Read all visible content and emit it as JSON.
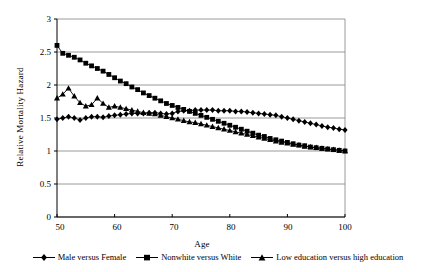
{
  "chart_data": {
    "type": "line",
    "title": "",
    "xlabel": "Age",
    "ylabel": "Relative Mortality Hazard",
    "xlim": [
      50,
      100
    ],
    "ylim": [
      0,
      3
    ],
    "xticks": [
      50,
      60,
      70,
      80,
      90,
      100
    ],
    "yticks": [
      0,
      0.5,
      1,
      1.5,
      2,
      2.5,
      3
    ],
    "ytick_labels": [
      "0",
      "0.5",
      "1",
      "1.5",
      "2",
      "2.5",
      "3"
    ],
    "xtick_labels": [
      "50",
      "60",
      "70",
      "80",
      "90",
      "100"
    ],
    "grid": "horizontal",
    "legend_position": "bottom",
    "x": [
      50,
      51,
      52,
      53,
      54,
      55,
      56,
      57,
      58,
      59,
      60,
      61,
      62,
      63,
      64,
      65,
      66,
      67,
      68,
      69,
      70,
      71,
      72,
      73,
      74,
      75,
      76,
      77,
      78,
      79,
      80,
      81,
      82,
      83,
      84,
      85,
      86,
      87,
      88,
      89,
      90,
      91,
      92,
      93,
      94,
      95,
      96,
      97,
      98,
      99,
      100
    ],
    "series": [
      {
        "name": "Male versus Female",
        "marker": "diamond",
        "values": [
          1.48,
          1.5,
          1.52,
          1.5,
          1.47,
          1.5,
          1.52,
          1.52,
          1.51,
          1.53,
          1.54,
          1.55,
          1.56,
          1.57,
          1.57,
          1.57,
          1.58,
          1.58,
          1.57,
          1.56,
          1.57,
          1.6,
          1.61,
          1.61,
          1.62,
          1.62,
          1.62,
          1.62,
          1.61,
          1.61,
          1.61,
          1.6,
          1.6,
          1.59,
          1.58,
          1.57,
          1.56,
          1.55,
          1.54,
          1.52,
          1.5,
          1.48,
          1.46,
          1.44,
          1.42,
          1.4,
          1.38,
          1.36,
          1.35,
          1.33,
          1.32
        ]
      },
      {
        "name": "Nonwhite versus White",
        "marker": "square",
        "values": [
          2.6,
          2.48,
          2.45,
          2.42,
          2.38,
          2.33,
          2.29,
          2.25,
          2.21,
          2.16,
          2.11,
          2.06,
          2.02,
          1.97,
          1.93,
          1.88,
          1.84,
          1.8,
          1.76,
          1.72,
          1.69,
          1.66,
          1.63,
          1.6,
          1.57,
          1.54,
          1.51,
          1.48,
          1.45,
          1.42,
          1.39,
          1.36,
          1.33,
          1.3,
          1.27,
          1.24,
          1.22,
          1.19,
          1.17,
          1.15,
          1.13,
          1.11,
          1.09,
          1.08,
          1.06,
          1.05,
          1.04,
          1.03,
          1.02,
          1.01,
          1.0
        ]
      },
      {
        "name": "Low education versus high education",
        "marker": "triangle",
        "values": [
          1.8,
          1.86,
          1.95,
          1.83,
          1.73,
          1.68,
          1.7,
          1.8,
          1.72,
          1.66,
          1.68,
          1.66,
          1.64,
          1.62,
          1.6,
          1.58,
          1.57,
          1.56,
          1.54,
          1.52,
          1.5,
          1.48,
          1.46,
          1.44,
          1.43,
          1.41,
          1.39,
          1.37,
          1.35,
          1.33,
          1.31,
          1.29,
          1.27,
          1.25,
          1.23,
          1.21,
          1.19,
          1.17,
          1.15,
          1.13,
          1.12,
          1.1,
          1.09,
          1.07,
          1.06,
          1.05,
          1.04,
          1.03,
          1.02,
          1.01,
          1.0
        ]
      }
    ]
  },
  "colors": {
    "series": "#000000",
    "grid": "#808080",
    "axis": "#000000",
    "background": "#ffffff"
  }
}
